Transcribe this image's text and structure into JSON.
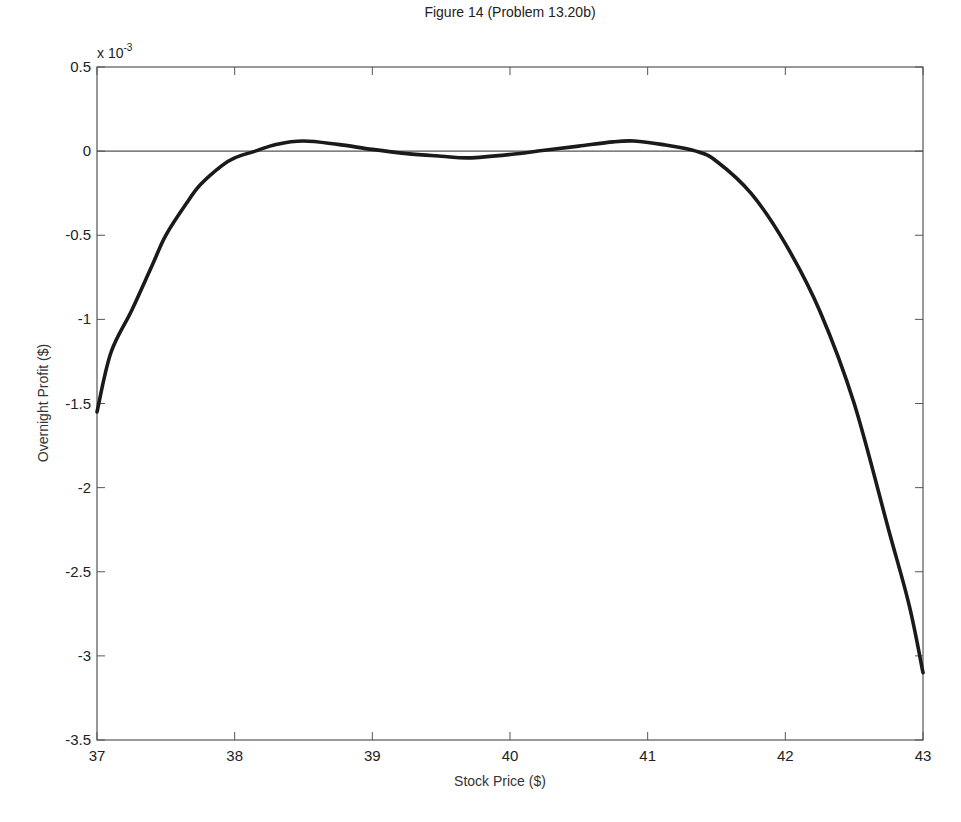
{
  "chart_data": {
    "type": "line",
    "title": "Figure 14 (Problem 13.20b)",
    "xlabel": "Stock Price ($)",
    "ylabel": "Overnight Profit ($)",
    "y_multiplier_label": "x 10",
    "y_multiplier_exponent": "-3",
    "xlim": [
      37,
      43
    ],
    "ylim": [
      -3.5,
      0.5
    ],
    "xticks": [
      37,
      38,
      39,
      40,
      41,
      42,
      43
    ],
    "xtick_labels": [
      "37",
      "38",
      "39",
      "40",
      "41",
      "42",
      "43"
    ],
    "yticks": [
      0.5,
      0,
      -0.5,
      -1,
      -1.5,
      -2,
      -2.5,
      -3,
      -3.5
    ],
    "ytick_labels": [
      "0.5",
      "0",
      "-0.5",
      "-1",
      "-1.5",
      "-2",
      "-2.5",
      "-3",
      "-3.5"
    ],
    "grid": false,
    "reference_line_y": 0,
    "series": [
      {
        "name": "Overnight Profit",
        "color": "#1a1a1a",
        "x": [
          37.0,
          37.1,
          37.25,
          37.4,
          37.5,
          37.65,
          37.75,
          37.9,
          38.0,
          38.15,
          38.3,
          38.5,
          38.75,
          39.0,
          39.25,
          39.5,
          39.7,
          40.0,
          40.25,
          40.5,
          40.75,
          40.9,
          41.1,
          41.35,
          41.5,
          41.75,
          42.0,
          42.25,
          42.5,
          42.75,
          42.9,
          43.0
        ],
        "y": [
          -1.55,
          -1.2,
          -0.95,
          -0.68,
          -0.5,
          -0.31,
          -0.2,
          -0.09,
          -0.04,
          0.0,
          0.04,
          0.06,
          0.04,
          0.01,
          -0.015,
          -0.03,
          -0.04,
          -0.02,
          0.005,
          0.03,
          0.055,
          0.06,
          0.04,
          0.0,
          -0.06,
          -0.25,
          -0.55,
          -0.95,
          -1.5,
          -2.25,
          -2.7,
          -3.1
        ]
      }
    ]
  }
}
